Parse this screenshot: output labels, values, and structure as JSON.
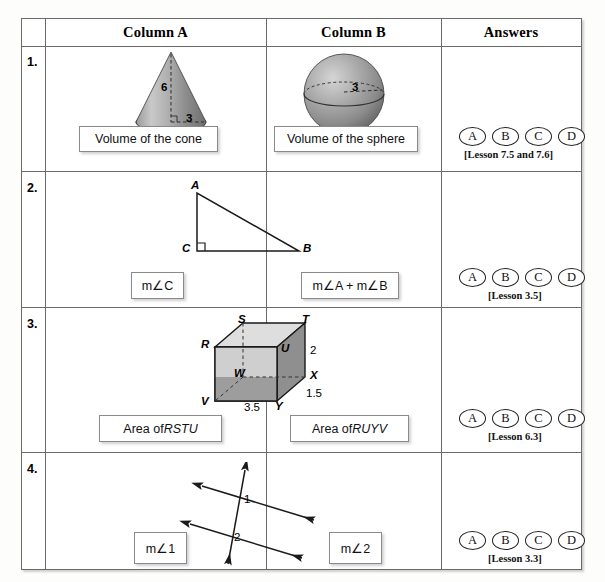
{
  "header": {
    "col_empty": "",
    "column_a": "Column A",
    "column_b": "Column B",
    "answers": "Answers"
  },
  "answer_choices": [
    "A",
    "B",
    "C",
    "D"
  ],
  "rows": [
    {
      "number": "1.",
      "column_a_label": "Volume of the cone",
      "column_b_label": "Volume of the sphere",
      "lesson": "[Lesson 7.5 and 7.6]",
      "figure_a": {
        "type": "cone",
        "height_label": "6",
        "radius_label": "3"
      },
      "figure_b": {
        "type": "sphere",
        "radius_label": "3"
      }
    },
    {
      "number": "2.",
      "column_a_label": "m∠C",
      "column_b_label": "m∠A + m∠B",
      "lesson": "[Lesson 3.5]",
      "figure_a": {
        "type": "right-triangle",
        "vertex_top": "A",
        "vertex_right_angle": "C",
        "vertex_right": "B"
      }
    },
    {
      "number": "3.",
      "column_a_label": "Area of RSTU",
      "column_a_label_plain": "Area of ",
      "column_a_label_italic": "RSTU",
      "column_b_label_plain": "Area of ",
      "column_b_label_italic": "RUYV",
      "lesson": "[Lesson 6.3]",
      "figure_a": {
        "type": "rectangular-prism",
        "vertices": [
          "R",
          "S",
          "T",
          "U",
          "V",
          "W",
          "X",
          "Y"
        ],
        "dim_height": "2",
        "dim_depth": "1.5",
        "dim_width": "3.5"
      }
    },
    {
      "number": "4.",
      "column_a_label": "m∠1",
      "column_b_label": "m∠2",
      "lesson": "[Lesson 3.3]",
      "figure_a": {
        "type": "parallel-lines-transversal",
        "angle_1": "1",
        "angle_2": "2"
      }
    }
  ],
  "colors": {
    "border": "#6a6a6a",
    "box_border": "#8a8a8a",
    "figure_stroke": "#1a1a1a",
    "shade_light": "#d8d8d8",
    "shade_mid": "#b4b4b4",
    "shade_dark": "#8f8f8f"
  }
}
